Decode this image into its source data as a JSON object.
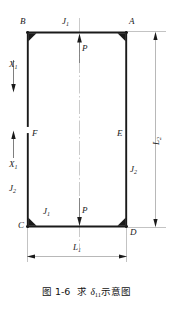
{
  "figure": {
    "title_prefix": "图 1-6",
    "title_body_pre": "求 ",
    "title_symbol": "δ",
    "title_symbol_sub": "11",
    "title_body_post": "示意图",
    "caption_full": "图 1-6  求 δ11示意图"
  },
  "nodes": [
    {
      "id": "B",
      "label": "B",
      "corner": "top-left"
    },
    {
      "id": "A",
      "label": "A",
      "corner": "top-right"
    },
    {
      "id": "C",
      "label": "C",
      "corner": "bottom-left"
    },
    {
      "id": "D",
      "label": "D",
      "corner": "bottom-right"
    },
    {
      "id": "F",
      "label": "F",
      "corner": "left-cut-lower"
    },
    {
      "id": "E",
      "label": "E",
      "corner": "right-mid"
    }
  ],
  "forces": {
    "x1_upper": {
      "label": "X",
      "sub": "1",
      "direction": "down"
    },
    "x1_lower": {
      "label": "X",
      "sub": "1",
      "direction": "up"
    },
    "p_upper": {
      "label": "P",
      "direction": "up"
    },
    "p_lower": {
      "label": "P",
      "direction": "down"
    }
  },
  "stiffness": {
    "j1_top": {
      "label": "J",
      "sub": "1"
    },
    "j1_bottom": {
      "label": "J",
      "sub": "1"
    },
    "j2_left": {
      "label": "J",
      "sub": "2"
    },
    "j2_right": {
      "label": "J",
      "sub": "2"
    }
  },
  "dimensions": {
    "l1": {
      "label": "L",
      "sub": "1",
      "orientation": "horizontal"
    },
    "l2": {
      "label": "L",
      "sub": "2",
      "orientation": "vertical"
    }
  },
  "colors": {
    "line": "#1a1a1a",
    "thin_line": "#9a9a9a",
    "center_line": "#b8b8b8",
    "text": "#1a1a1a",
    "background": "#ffffff"
  }
}
